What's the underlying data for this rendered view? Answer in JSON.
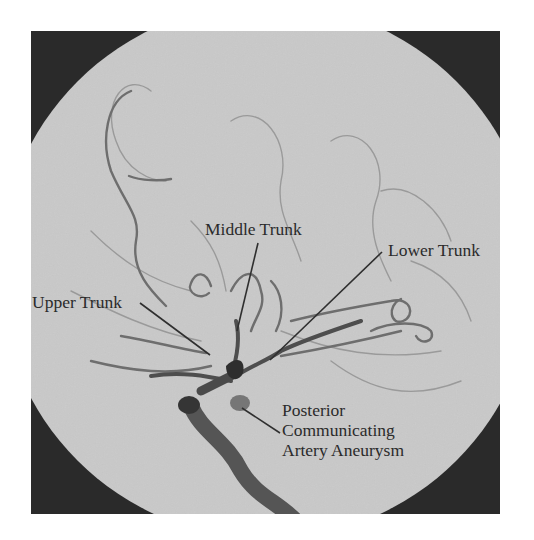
{
  "figure": {
    "colors": {
      "background_dark": "#2a2a2a",
      "field": "#c9c9c9",
      "vessel": "#6e6e6e",
      "vessel_dark": "#3a3a3a",
      "label_text": "#2b2b2b",
      "leader_line": "#2f2f2f"
    }
  },
  "labels": {
    "middle_trunk": "Middle Trunk",
    "lower_trunk": "Lower Trunk",
    "upper_trunk": "Upper Trunk",
    "aneurysm": [
      "Posterior",
      "Communicating",
      "Artery Aneurysm"
    ]
  }
}
